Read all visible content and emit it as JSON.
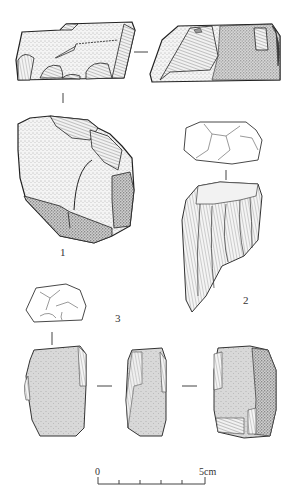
{
  "figure": {
    "artifacts": [
      {
        "id": "1",
        "label": "1",
        "views": [
          "side-view-left",
          "side-view-right",
          "face-view-cortex"
        ]
      },
      {
        "id": "2",
        "label": "2",
        "views": [
          "platform-view",
          "face-view-flaked"
        ]
      },
      {
        "id": "3",
        "label": "3",
        "views": [
          "platform-view",
          "face-view",
          "side-view",
          "face-view-reverse"
        ]
      }
    ],
    "scale_bar": {
      "start_label": "0",
      "end_label": "5cm",
      "divisions": 5
    },
    "colors": {
      "ink": "#222222",
      "stipple": "#555555",
      "background": "#ffffff"
    }
  }
}
